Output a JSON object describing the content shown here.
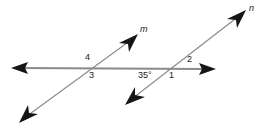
{
  "figure": {
    "kind": "geometry-diagram",
    "background_color": "#ffffff",
    "line_color": "#8a8a8a",
    "arrow_color": "#1a1a1a",
    "text_color": "#1a1a1a"
  },
  "lines": [
    {
      "id": "horizontal",
      "name": "",
      "x1": 12,
      "y1": 68,
      "x2": 216,
      "y2": 69,
      "arrow_start": true,
      "arrow_end": true,
      "stroke_width": 1.6
    },
    {
      "id": "transversal-m",
      "name": "m",
      "x1": 20,
      "y1": 122,
      "x2": 138,
      "y2": 35,
      "arrow_start": true,
      "arrow_end": true,
      "stroke_width": 1.1
    },
    {
      "id": "transversal-n",
      "name": "n",
      "x1": 126,
      "y1": 104,
      "x2": 246,
      "y2": 11,
      "arrow_start": true,
      "arrow_end": true,
      "stroke_width": 1.1
    }
  ],
  "line_labels": [
    {
      "id": "label-m",
      "text": "m",
      "x": 140,
      "y": 26
    },
    {
      "id": "label-n",
      "text": "n",
      "x": 249,
      "y": 5
    }
  ],
  "intersections": [
    {
      "id": "vertex-m",
      "x": 94,
      "y": 68
    },
    {
      "id": "vertex-n",
      "x": 173,
      "y": 69
    }
  ],
  "angle_labels": [
    {
      "id": "angle-4",
      "text": "4",
      "x": 85,
      "y": 54,
      "position": "above-left of vertex m"
    },
    {
      "id": "angle-3",
      "text": "3",
      "x": 89,
      "y": 71,
      "position": "below-left of vertex m"
    },
    {
      "id": "angle-2",
      "text": "2",
      "x": 187,
      "y": 56,
      "position": "above-right of vertex n"
    },
    {
      "id": "angle-1",
      "text": "1",
      "x": 169,
      "y": 71,
      "position": "below-right of vertex n"
    }
  ],
  "angle_measures": [
    {
      "id": "angle-35",
      "text": "35°",
      "x": 139,
      "y": 71,
      "position": "below-left of vertex n"
    }
  ]
}
